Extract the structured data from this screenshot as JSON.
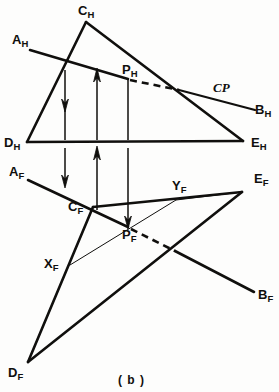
{
  "figure": {
    "caption": "( b )",
    "caption_x": 118,
    "caption_y": 374,
    "ink_color": "#100f0d",
    "background_color": "#fdfdfc",
    "width": 279,
    "height": 392
  },
  "views": {
    "top": {
      "name": "top-view-horizontal-projection"
    },
    "front": {
      "name": "front-view-frontal-projection"
    }
  },
  "labels": [
    {
      "id": "C_H",
      "base": "C",
      "sub": "H",
      "x": 78,
      "y": 2,
      "name": "label-c-h"
    },
    {
      "id": "A_H",
      "base": "A",
      "sub": "H",
      "x": 12,
      "y": 31,
      "name": "label-a-h"
    },
    {
      "id": "P_H",
      "base": "P",
      "sub": "H",
      "x": 122,
      "y": 61,
      "name": "label-p-h"
    },
    {
      "id": "CP",
      "base": "CP",
      "sub": "",
      "x": 213,
      "y": 81,
      "name": "label-cp"
    },
    {
      "id": "B_H",
      "base": "B",
      "sub": "H",
      "x": 255,
      "y": 101,
      "name": "label-b-h"
    },
    {
      "id": "D_H",
      "base": "D",
      "sub": "H",
      "x": 4,
      "y": 134,
      "name": "label-d-h"
    },
    {
      "id": "E_H",
      "base": "E",
      "sub": "H",
      "x": 251,
      "y": 134,
      "name": "label-e-h"
    },
    {
      "id": "A_F",
      "base": "A",
      "sub": "F",
      "x": 9,
      "y": 163,
      "name": "label-a-f"
    },
    {
      "id": "C_F",
      "base": "C",
      "sub": "F",
      "x": 68,
      "y": 198,
      "name": "label-c-f"
    },
    {
      "id": "Y_F",
      "base": "Y",
      "sub": "F",
      "x": 172,
      "y": 177,
      "name": "label-y-f"
    },
    {
      "id": "E_F",
      "base": "E",
      "sub": "F",
      "x": 254,
      "y": 170,
      "name": "label-e-f"
    },
    {
      "id": "P_F",
      "base": "P",
      "sub": "F",
      "x": 122,
      "y": 226,
      "name": "label-p-f"
    },
    {
      "id": "X_F",
      "base": "X",
      "sub": "F",
      "x": 44,
      "y": 255,
      "name": "label-x-f"
    },
    {
      "id": "B_F",
      "base": "B",
      "sub": "F",
      "x": 258,
      "y": 286,
      "name": "label-b-f"
    },
    {
      "id": "D_F",
      "base": "D",
      "sub": "F",
      "x": 8,
      "y": 364,
      "name": "label-d-f"
    }
  ],
  "geometry": {
    "points": {
      "C_H": [
        86,
        22
      ],
      "A_H_end": [
        30,
        50
      ],
      "B_H_end": [
        255,
        110
      ],
      "D_H": [
        27,
        142
      ],
      "E_H": [
        243,
        141
      ],
      "P_H": [
        128,
        79
      ],
      "dash_H_end": [
        178,
        90
      ],
      "A_F_end": [
        28,
        180
      ],
      "C_F": [
        93,
        207
      ],
      "E_F": [
        242,
        192
      ],
      "P_F": [
        128,
        227
      ],
      "dash_F_end": [
        174,
        251
      ],
      "B_F_end": [
        254,
        292
      ],
      "D_F": [
        28,
        362
      ],
      "X_F": [
        70,
        265
      ],
      "Y_F": [
        176,
        200
      ]
    },
    "projector_x": [
      65,
      97,
      128
    ],
    "strokes": {
      "heavy_width": 2.6,
      "medium_width": 2.2,
      "thin_width": 1.0,
      "dash_pattern": "7,5"
    }
  }
}
